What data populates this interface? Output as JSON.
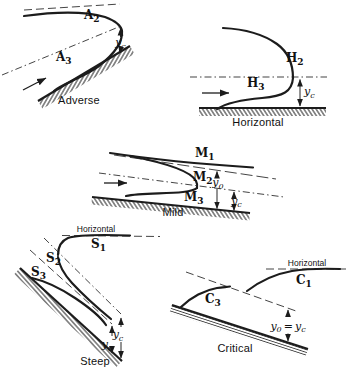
{
  "figure_kind": "open-channel gradually varied flow profiles",
  "ink_color": "#1c1c1c",
  "panels": {
    "adverse": {
      "caption": "Adverse",
      "curve_labels": [
        {
          "main": "A",
          "sub": "2"
        },
        {
          "main": "A",
          "sub": "3"
        }
      ],
      "dim_labels": [
        {
          "main": "y",
          "sub": "c"
        }
      ]
    },
    "horizontal": {
      "caption": "Horizontal",
      "curve_labels": [
        {
          "main": "H",
          "sub": "2"
        },
        {
          "main": "H",
          "sub": "3"
        }
      ],
      "dim_labels": [
        {
          "main": "y",
          "sub": "c"
        }
      ]
    },
    "mild": {
      "caption": "Mild",
      "curve_labels": [
        {
          "main": "M",
          "sub": "1"
        },
        {
          "main": "M",
          "sub": "2"
        },
        {
          "main": "M",
          "sub": "3"
        }
      ],
      "dim_labels": [
        {
          "main": "y",
          "sub": "0"
        },
        {
          "main": "y",
          "sub": "c"
        }
      ]
    },
    "steep": {
      "caption": "Steep",
      "horizontal_ref_label": "Horizontal",
      "curve_labels": [
        {
          "main": "S",
          "sub": "1"
        },
        {
          "main": "S",
          "sub": "2"
        },
        {
          "main": "S",
          "sub": "3"
        }
      ],
      "dim_labels": [
        {
          "main": "y",
          "sub": "c"
        },
        {
          "main": "y",
          "sub": "0"
        }
      ]
    },
    "critical": {
      "caption": "Critical",
      "horizontal_ref_label": "Horizontal",
      "curve_labels": [
        {
          "main": "C",
          "sub": "3"
        },
        {
          "main": "C",
          "sub": "1"
        }
      ],
      "dim_equation": {
        "lhs_main": "y",
        "lhs_sub": "0",
        "operator": "=",
        "rhs_main": "y",
        "rhs_sub": "c"
      }
    }
  }
}
